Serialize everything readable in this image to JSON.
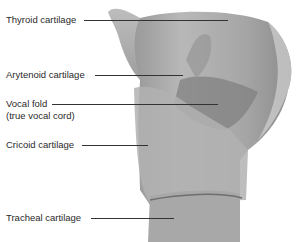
{
  "figure": {
    "labels": [
      {
        "id": "thyroid",
        "text": "Thyroid cartilage",
        "x": 6,
        "y": 14,
        "line": {
          "x1": 84,
          "x2": 228,
          "y": 20
        }
      },
      {
        "id": "arytenoid",
        "text": "Arytenoid cartilage",
        "x": 6,
        "y": 69,
        "line": {
          "x1": 95,
          "x2": 183,
          "y": 75
        }
      },
      {
        "id": "vocal-fold",
        "text": "Vocal fold",
        "text2": "(true vocal cord)",
        "x": 6,
        "y": 98,
        "line": {
          "x1": 52,
          "x2": 218,
          "y": 104
        }
      },
      {
        "id": "cricoid",
        "text": "Cricoid cartilage",
        "x": 6,
        "y": 139,
        "line": {
          "x1": 82,
          "x2": 148,
          "y": 145
        }
      },
      {
        "id": "tracheal",
        "text": "Tracheal cartilage",
        "x": 6,
        "y": 212,
        "line": {
          "x1": 91,
          "x2": 174,
          "y": 218
        }
      }
    ]
  }
}
